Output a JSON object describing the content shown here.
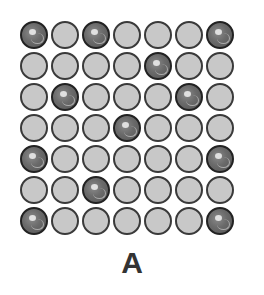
{
  "figure": {
    "label": "A",
    "grid": {
      "rows": 7,
      "cols": 7,
      "colors": {
        "light": "#c8c8c8",
        "dark": "#6a6a6a",
        "outline": "#333333"
      },
      "cells": [
        [
          "dark",
          "light",
          "dark",
          "light",
          "light",
          "light",
          "dark"
        ],
        [
          "light",
          "light",
          "light",
          "light",
          "dark",
          "light",
          "light"
        ],
        [
          "light",
          "dark",
          "light",
          "light",
          "light",
          "dark",
          "light"
        ],
        [
          "light",
          "light",
          "light",
          "dark",
          "light",
          "light",
          "light"
        ],
        [
          "dark",
          "light",
          "light",
          "light",
          "light",
          "light",
          "dark"
        ],
        [
          "light",
          "light",
          "dark",
          "light",
          "light",
          "light",
          "light"
        ],
        [
          "dark",
          "light",
          "light",
          "light",
          "light",
          "light",
          "dark"
        ]
      ]
    }
  }
}
